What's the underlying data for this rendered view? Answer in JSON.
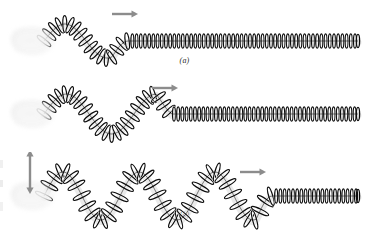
{
  "figure": {
    "background_color": "#ffffff",
    "spring_color": "#0d0d0d",
    "spring_highlight_color": "#f2f2f2",
    "arrow_color": "#8c8c8c",
    "hand_color": "#ededed",
    "caption_color": "#2b2b2b"
  },
  "panels": [
    {
      "id": "a",
      "caption": "(a)",
      "description": "One upward pulse travels to the right along the spring; the hand at the left has flicked the end up once.",
      "pulse_count": 1,
      "hand": {
        "name": "hand",
        "motion": "single-flick",
        "blurred": true
      },
      "arrow": {
        "name": "propagation-arrow",
        "direction": "right",
        "label": "",
        "x": 112,
        "y": 14,
        "length": 26
      },
      "wave": {
        "baseline_y": 41,
        "start_x": 44,
        "end_x": 358,
        "wave_end_x": 128,
        "amplitude": 17,
        "wavelength": 84,
        "coil_spacing_wave": 5.2,
        "coil_spacing_rest": 4.2
      }
    },
    {
      "id": "b",
      "caption": "(b)",
      "description": "The hand has moved up and back down: one full wave cycle (a crest and a trough) now travels to the right.",
      "pulse_count": 2,
      "hand": {
        "name": "hand",
        "motion": "one-cycle",
        "blurred": true
      },
      "arrow": {
        "name": "propagation-arrow",
        "direction": "right",
        "label": "",
        "x": 152,
        "y": 88,
        "length": 26
      },
      "wave": {
        "baseline_y": 114,
        "start_x": 44,
        "end_x": 358,
        "wave_end_x": 172,
        "amplitude": 20,
        "wavelength": 90,
        "coil_spacing_wave": 5.2,
        "coil_spacing_rest": 4.2
      }
    },
    {
      "id": "c",
      "caption": "(c)",
      "description": "The hand oscillates continuously up and down, producing a continuous sinusoidal transverse wave that travels to the right.",
      "pulse_count": 4,
      "hand": {
        "name": "hand",
        "motion": "continuous-oscillation",
        "blurred": true
      },
      "arrow": {
        "name": "propagation-arrow",
        "direction": "right",
        "label": "",
        "x": 240,
        "y": 172,
        "length": 26
      },
      "oscillation_arrow": {
        "name": "hand-oscillation-arrow",
        "direction": "up-down",
        "label": "",
        "x": 30,
        "y": 172,
        "height": 44
      },
      "wave": {
        "baseline_y": 196,
        "start_x": 44,
        "end_x": 358,
        "wave_end_x": 272,
        "amplitude": 24,
        "wavelength": 76,
        "coil_spacing_wave": 5.4,
        "coil_spacing_rest": 4.2
      }
    }
  ]
}
